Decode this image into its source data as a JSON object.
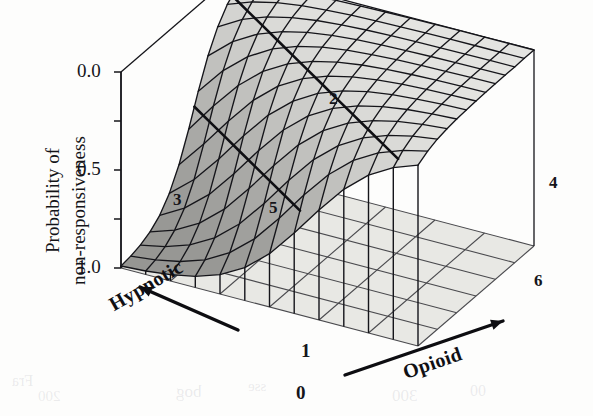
{
  "figure": {
    "background_color": "#fdfdfc",
    "ink_color": "#15151a"
  },
  "axes": {
    "vertical": {
      "title_line1": "Probability of",
      "title_line2": "non-responsiveness",
      "tick_labels": [
        "1.0",
        "0.5",
        "0.0"
      ],
      "tick_values": [
        1.0,
        0.5,
        0.0
      ],
      "minor_tick_values": [
        0.75,
        0.25
      ],
      "range": [
        0.0,
        1.0
      ]
    },
    "depth": {
      "title": "Hypnotic",
      "arrow": "arrow-up-left",
      "corner_label": "1"
    },
    "horizontal": {
      "title": "Opioid",
      "arrow": "arrow-up-right",
      "corner_label": "0"
    }
  },
  "surface_labels": [
    {
      "text": "2",
      "x": 329,
      "y": 90
    },
    {
      "text": "3",
      "x": 173,
      "y": 191
    },
    {
      "text": "5",
      "x": 269,
      "y": 199
    },
    {
      "text": "4",
      "x": 549,
      "y": 174
    },
    {
      "text": "6",
      "x": 534,
      "y": 272
    },
    {
      "text": "1",
      "x": 301,
      "y": 341
    },
    {
      "text": "0",
      "x": 296,
      "y": 383
    }
  ],
  "chart_data": {
    "type": "surface",
    "title": "",
    "xlabel": "Opioid",
    "ylabel": "Hypnotic",
    "zlabel": "Probability of non-responsiveness",
    "zlim": [
      0.0,
      1.0
    ],
    "ztick_labels": [
      "0.0",
      "0.5",
      "1.0"
    ],
    "grid": true,
    "legend": "none",
    "mesh": {
      "nx": 13,
      "ny": 13
    },
    "model": {
      "form": "logistic",
      "intercept": -4.6,
      "opioid_coeff": 7.2,
      "hypnotic_coeff": 7.2,
      "interaction_coeff": 5.0
    },
    "x": [
      0,
      0.0833,
      0.1667,
      0.25,
      0.3333,
      0.4167,
      0.5,
      0.5833,
      0.6667,
      0.75,
      0.8333,
      0.9167,
      1
    ],
    "y": [
      0,
      0.0833,
      0.1667,
      0.25,
      0.3333,
      0.4167,
      0.5,
      0.5833,
      0.6667,
      0.75,
      0.8333,
      0.9167,
      1
    ],
    "z": [
      [
        0.01,
        0.018,
        0.032,
        0.057,
        0.099,
        0.168,
        0.272,
        0.41,
        0.562,
        0.7,
        0.805,
        0.877,
        0.923
      ],
      [
        0.018,
        0.032,
        0.057,
        0.099,
        0.168,
        0.272,
        0.41,
        0.562,
        0.7,
        0.805,
        0.877,
        0.923,
        0.952
      ],
      [
        0.032,
        0.057,
        0.099,
        0.168,
        0.272,
        0.41,
        0.562,
        0.7,
        0.805,
        0.877,
        0.923,
        0.952,
        0.97
      ],
      [
        0.057,
        0.099,
        0.168,
        0.272,
        0.41,
        0.562,
        0.7,
        0.805,
        0.877,
        0.923,
        0.952,
        0.97,
        0.981
      ],
      [
        0.099,
        0.168,
        0.272,
        0.41,
        0.562,
        0.7,
        0.805,
        0.877,
        0.923,
        0.952,
        0.97,
        0.981,
        0.988
      ],
      [
        0.168,
        0.272,
        0.41,
        0.562,
        0.7,
        0.805,
        0.877,
        0.923,
        0.952,
        0.97,
        0.981,
        0.988,
        0.992
      ],
      [
        0.272,
        0.41,
        0.562,
        0.7,
        0.805,
        0.877,
        0.923,
        0.952,
        0.97,
        0.981,
        0.988,
        0.992,
        0.995
      ],
      [
        0.41,
        0.562,
        0.7,
        0.805,
        0.877,
        0.923,
        0.952,
        0.97,
        0.981,
        0.988,
        0.992,
        0.995,
        0.997
      ],
      [
        0.562,
        0.7,
        0.805,
        0.877,
        0.923,
        0.952,
        0.97,
        0.981,
        0.988,
        0.992,
        0.995,
        0.997,
        0.998
      ],
      [
        0.7,
        0.805,
        0.877,
        0.923,
        0.952,
        0.97,
        0.981,
        0.988,
        0.992,
        0.995,
        0.997,
        0.998,
        0.999
      ],
      [
        0.805,
        0.877,
        0.923,
        0.952,
        0.97,
        0.981,
        0.988,
        0.992,
        0.995,
        0.997,
        0.998,
        0.999,
        0.999
      ],
      [
        0.877,
        0.923,
        0.952,
        0.97,
        0.981,
        0.988,
        0.992,
        0.995,
        0.997,
        0.998,
        0.999,
        0.999,
        1.0
      ],
      [
        0.923,
        0.952,
        0.97,
        0.981,
        0.988,
        0.992,
        0.995,
        0.997,
        0.998,
        0.999,
        0.999,
        1.0,
        1.0
      ]
    ],
    "contour_levels": [
      0.9,
      0.5
    ],
    "view": {
      "azimuth": -52,
      "elevation": 22
    }
  },
  "scan_artifacts": {
    "bleed_through": [
      {
        "text": "bog",
        "x": 176,
        "y": 382,
        "size": 17
      },
      {
        "text": "sse",
        "x": 248,
        "y": 378,
        "size": 15
      },
      {
        "text": "Fra",
        "x": 12,
        "y": 372,
        "size": 16
      },
      {
        "text": "300",
        "x": 392,
        "y": 386,
        "size": 17
      },
      {
        "text": "00",
        "x": 470,
        "y": 382,
        "size": 16
      },
      {
        "text": "200",
        "x": 38,
        "y": 388,
        "size": 15
      }
    ]
  }
}
